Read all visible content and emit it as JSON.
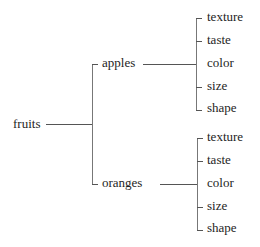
{
  "diagram": {
    "type": "tree",
    "root": {
      "label": "fruits",
      "children": [
        {
          "label": "apples",
          "children": [
            {
              "label": "texture"
            },
            {
              "label": "taste"
            },
            {
              "label": "color"
            },
            {
              "label": "size"
            },
            {
              "label": "shape"
            }
          ]
        },
        {
          "label": "oranges",
          "children": [
            {
              "label": "texture"
            },
            {
              "label": "taste"
            },
            {
              "label": "color"
            },
            {
              "label": "size"
            },
            {
              "label": "shape"
            }
          ]
        }
      ]
    },
    "line_color": "#555555",
    "text_color": "#1e1e1e"
  }
}
